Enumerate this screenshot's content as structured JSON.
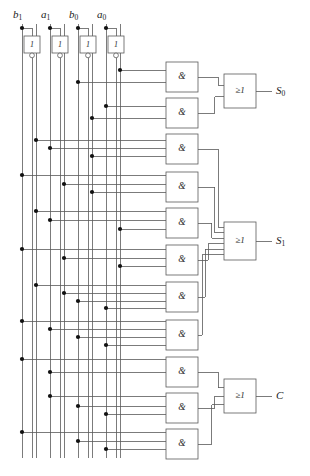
{
  "figure": {
    "kind": "logic-circuit-schematic",
    "stroke_color": "#5a5a5a",
    "dot_color": "#111111",
    "text_color": "#2a2a2a",
    "background": "#ffffff",
    "width": 310,
    "height": 476
  },
  "inputs": [
    {
      "name": "b1",
      "base": "b",
      "sub": "1",
      "x": 22
    },
    {
      "name": "a1",
      "base": "a",
      "sub": "1",
      "x": 50
    },
    {
      "name": "b0",
      "base": "b",
      "sub": "0",
      "x": 78
    },
    {
      "name": "a0",
      "base": "a",
      "sub": "0",
      "x": 106
    }
  ],
  "inverters": [
    {
      "name": "inverter-b1",
      "label": "1",
      "x": 27,
      "y": 36
    },
    {
      "name": "inverter-a1",
      "label": "1",
      "x": 55,
      "y": 36
    },
    {
      "name": "inverter-b0",
      "label": "1",
      "x": 83,
      "y": 36
    },
    {
      "name": "inverter-a0",
      "label": "1",
      "x": 111,
      "y": 36
    }
  ],
  "bus_lines": [
    {
      "name": "bus-b1",
      "x": 22,
      "signal": "b1"
    },
    {
      "name": "bus-b1-not",
      "x": 36,
      "signal": "b1-not"
    },
    {
      "name": "bus-a1",
      "x": 50,
      "signal": "a1"
    },
    {
      "name": "bus-a1-not",
      "x": 64,
      "signal": "a1-not"
    },
    {
      "name": "bus-b0",
      "x": 78,
      "signal": "b0"
    },
    {
      "name": "bus-b0-not",
      "x": 92,
      "signal": "b0-not"
    },
    {
      "name": "bus-a0",
      "x": 106,
      "signal": "a0"
    },
    {
      "name": "bus-a0-not",
      "x": 120,
      "signal": "a0-not"
    }
  ],
  "and_gates": [
    {
      "name": "and-gate-1",
      "label": "&",
      "x": 166,
      "y": 62,
      "w": 32,
      "h": 30,
      "inputs": [
        {
          "bus": 120,
          "y": 70
        },
        {
          "bus": 78,
          "y": 82
        }
      ]
    },
    {
      "name": "and-gate-2",
      "label": "&",
      "x": 166,
      "y": 98,
      "w": 32,
      "h": 30,
      "inputs": [
        {
          "bus": 106,
          "y": 106
        },
        {
          "bus": 92,
          "y": 118
        }
      ]
    },
    {
      "name": "and-gate-3",
      "label": "&",
      "x": 166,
      "y": 134,
      "w": 32,
      "h": 30,
      "inputs": [
        {
          "bus": 36,
          "y": 140
        },
        {
          "bus": 50,
          "y": 148
        },
        {
          "bus": 92,
          "y": 156
        }
      ]
    },
    {
      "name": "and-gate-4",
      "label": "&",
      "x": 166,
      "y": 172,
      "w": 32,
      "h": 30,
      "inputs": [
        {
          "bus": 22,
          "y": 175
        },
        {
          "bus": 64,
          "y": 184
        },
        {
          "bus": 92,
          "y": 192
        }
      ]
    },
    {
      "name": "and-gate-5",
      "label": "&",
      "x": 166,
      "y": 208,
      "w": 32,
      "h": 30,
      "inputs": [
        {
          "bus": 36,
          "y": 211
        },
        {
          "bus": 50,
          "y": 220
        },
        {
          "bus": 120,
          "y": 229
        }
      ]
    },
    {
      "name": "and-gate-6",
      "label": "&",
      "x": 166,
      "y": 245,
      "w": 32,
      "h": 30,
      "inputs": [
        {
          "bus": 22,
          "y": 249
        },
        {
          "bus": 64,
          "y": 258
        },
        {
          "bus": 120,
          "y": 266
        }
      ]
    },
    {
      "name": "and-gate-7",
      "label": "&",
      "x": 166,
      "y": 282,
      "w": 32,
      "h": 30,
      "inputs": [
        {
          "bus": 36,
          "y": 285
        },
        {
          "bus": 64,
          "y": 293
        },
        {
          "bus": 78,
          "y": 301
        },
        {
          "bus": 106,
          "y": 308
        }
      ]
    },
    {
      "name": "and-gate-8",
      "label": "&",
      "x": 166,
      "y": 320,
      "w": 32,
      "h": 30,
      "inputs": [
        {
          "bus": 22,
          "y": 321
        },
        {
          "bus": 50,
          "y": 329
        },
        {
          "bus": 78,
          "y": 337
        },
        {
          "bus": 106,
          "y": 345
        }
      ]
    },
    {
      "name": "and-gate-9",
      "label": "&",
      "x": 166,
      "y": 357,
      "w": 32,
      "h": 30,
      "inputs": [
        {
          "bus": 22,
          "y": 359
        },
        {
          "bus": 50,
          "y": 372
        }
      ]
    },
    {
      "name": "and-gate-10",
      "label": "&",
      "x": 166,
      "y": 393,
      "w": 32,
      "h": 30,
      "inputs": [
        {
          "bus": 50,
          "y": 396
        },
        {
          "bus": 78,
          "y": 406
        },
        {
          "bus": 106,
          "y": 414
        }
      ]
    },
    {
      "name": "and-gate-11",
      "label": "&",
      "x": 166,
      "y": 429,
      "w": 32,
      "h": 30,
      "inputs": [
        {
          "bus": 22,
          "y": 432
        },
        {
          "bus": 78,
          "y": 441
        },
        {
          "bus": 106,
          "y": 449
        }
      ]
    }
  ],
  "or_gates": [
    {
      "name": "or-gate-s0",
      "label": "≥1",
      "x": 224,
      "y": 74,
      "w": 32,
      "h": 34,
      "from": [
        1,
        2
      ],
      "out_y": 91
    },
    {
      "name": "or-gate-s1",
      "label": "≥1",
      "x": 224,
      "y": 222,
      "w": 32,
      "h": 38,
      "from": [
        3,
        4,
        5,
        6,
        7,
        8
      ],
      "out_y": 241
    },
    {
      "name": "or-gate-c",
      "label": "≥1",
      "x": 224,
      "y": 379,
      "w": 32,
      "h": 34,
      "from": [
        9,
        10,
        11
      ],
      "out_y": 396
    }
  ],
  "outputs": [
    {
      "name": "output-s0",
      "base": "S",
      "sub": "0",
      "x": 276,
      "y": 91
    },
    {
      "name": "output-s1",
      "base": "S",
      "sub": "1",
      "x": 276,
      "y": 241
    },
    {
      "name": "output-c",
      "base": "C",
      "sub": "",
      "x": 276,
      "y": 396
    }
  ]
}
